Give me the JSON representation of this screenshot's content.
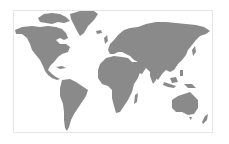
{
  "map": {
    "type": "world-map",
    "projection": "equirectangular-like",
    "colors": {
      "land": "#8a8a8a",
      "water": "#ffffff",
      "frame_border": "#e6e6e6"
    },
    "continents": [
      {
        "name": "North America"
      },
      {
        "name": "Greenland"
      },
      {
        "name": "South America"
      },
      {
        "name": "Europe"
      },
      {
        "name": "Africa"
      },
      {
        "name": "Asia"
      },
      {
        "name": "Australia"
      },
      {
        "name": "New Zealand"
      },
      {
        "name": "Madagascar"
      }
    ]
  }
}
